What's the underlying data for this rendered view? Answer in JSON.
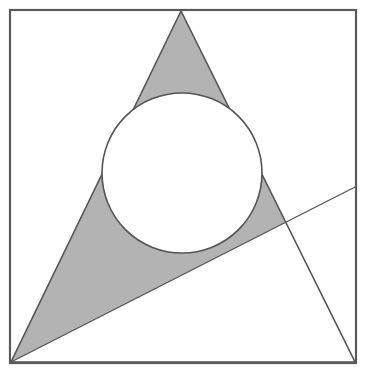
{
  "figure": {
    "canvas": {
      "width": 367,
      "height": 378,
      "background": "#ffffff"
    },
    "colors": {
      "shaded_region": "#b3b3b3",
      "stroke": "#555555",
      "frame_stroke": "#5a5a5a",
      "circle_fill": "#ffffff",
      "background": "#ffffff"
    },
    "strokes": {
      "frame_width": 2.2,
      "triangle_width": 1.6,
      "circle_width": 1.6,
      "line_width": 1.4
    }
  },
  "chart_data": {
    "type": "diagram",
    "shapes": [
      {
        "name": "outer-square",
        "type": "rect",
        "x": 10,
        "y": 10,
        "width": 346,
        "height": 353,
        "fill": "none",
        "stroke": "#5a5a5a",
        "stroke_width": 2.2
      },
      {
        "name": "triangle",
        "type": "polygon",
        "points": "181,11 11,362 355,362",
        "vertices": [
          {
            "label": "apex",
            "x": 181,
            "y": 11
          },
          {
            "label": "bottom-left",
            "x": 11,
            "y": 362
          },
          {
            "label": "bottom-right",
            "x": 355,
            "y": 362
          }
        ],
        "fill": "none",
        "stroke": "#555555",
        "stroke_width": 1.6
      },
      {
        "name": "inscribed-circle",
        "type": "circle",
        "cx": 182,
        "cy": 173,
        "r": 80,
        "fill": "#ffffff",
        "stroke": "#555555",
        "stroke_width": 1.6
      },
      {
        "name": "secant-line",
        "type": "line",
        "x1": 11,
        "y1": 362,
        "x2": 357,
        "y2": 186,
        "stroke": "#555555",
        "stroke_width": 1.4
      }
    ],
    "shaded_region": {
      "description": "Portion of the triangle lying above the secant line, excluding the inscribed circle",
      "fill": "#b3b3b3",
      "clip_polygon": "181,11 355,362 11,362",
      "upper_half_plane_polygon": "11,362 357,186 357,0 0,0 0,362",
      "excluded_circle": {
        "cx": 182,
        "cy": 173,
        "r": 80
      }
    },
    "xlim": [
      0,
      367
    ],
    "ylim": [
      0,
      378
    ],
    "grid": false,
    "legend": null
  }
}
